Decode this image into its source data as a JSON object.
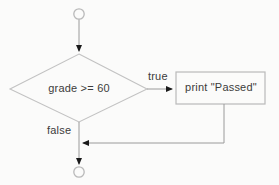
{
  "diagram": {
    "type": "flowchart",
    "colors": {
      "background": "#fbfbfa",
      "stroke": "#b9b9b9",
      "connector": "#8f8f8f",
      "text": "#3b3b3b"
    },
    "nodes": {
      "start_terminator": {
        "shape": "circle",
        "label": ""
      },
      "decision": {
        "shape": "diamond",
        "label": "grade >= 60"
      },
      "process": {
        "shape": "rectangle",
        "label": "print \"Passed\""
      },
      "end_terminator": {
        "shape": "circle",
        "label": ""
      }
    },
    "edges": {
      "true_branch": {
        "label": "true",
        "from": "decision",
        "to": "process"
      },
      "false_branch": {
        "label": "false",
        "from": "decision",
        "to": "end_terminator"
      },
      "merge_branch": {
        "label": "",
        "from": "process",
        "to": "end_terminator"
      }
    }
  }
}
